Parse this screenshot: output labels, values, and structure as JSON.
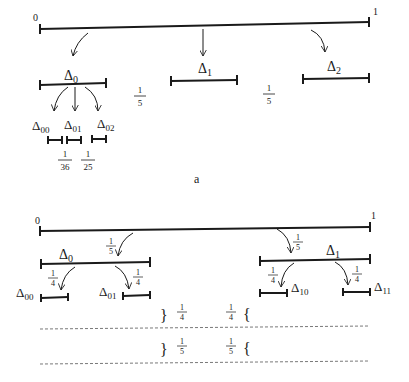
{
  "figure_a": {
    "caption": "a",
    "endpoint_left": "0",
    "endpoint_right": "1",
    "intervals": [
      {
        "name": "Δ",
        "sub": "0"
      },
      {
        "name": "Δ",
        "sub": "1"
      },
      {
        "name": "Δ",
        "sub": "2"
      }
    ],
    "sub_intervals": [
      {
        "name": "Δ",
        "sub": "00"
      },
      {
        "name": "Δ",
        "sub": "01"
      },
      {
        "name": "Δ",
        "sub": "02"
      }
    ],
    "gap_fractions": [
      {
        "num": "1",
        "den": "5"
      },
      {
        "num": "1",
        "den": "5"
      }
    ],
    "sub_gap_fractions": [
      {
        "num": "1",
        "den": "36"
      },
      {
        "num": "1",
        "den": "25"
      }
    ]
  },
  "figure_b": {
    "endpoint_left": "0",
    "endpoint_right": "1",
    "intervals": [
      {
        "name": "Δ",
        "sub": "0"
      },
      {
        "name": "Δ",
        "sub": "1"
      }
    ],
    "sub_intervals": [
      {
        "name": "Δ",
        "sub": "00"
      },
      {
        "name": "Δ",
        "sub": "01"
      },
      {
        "name": "Δ",
        "sub": "10"
      },
      {
        "name": "Δ",
        "sub": "11"
      }
    ],
    "arrow_fractions": {
      "to_d0": {
        "num": "1",
        "den": "5"
      },
      "to_d1": {
        "num": "1",
        "den": "5"
      },
      "to_d00": {
        "num": "1",
        "den": "4"
      },
      "to_d01": {
        "num": "1",
        "den": "4"
      },
      "to_d10": {
        "num": "1",
        "den": "4"
      },
      "to_d11": {
        "num": "1",
        "den": "4"
      }
    },
    "brace_rows": [
      {
        "left": {
          "num": "1",
          "den": "4"
        },
        "right": {
          "num": "1",
          "den": "4"
        }
      },
      {
        "left": {
          "num": "1",
          "den": "5"
        },
        "right": {
          "num": "1",
          "den": "5"
        }
      }
    ]
  },
  "colors": {
    "ink": "#1a1a1a",
    "dash": "#555555"
  }
}
